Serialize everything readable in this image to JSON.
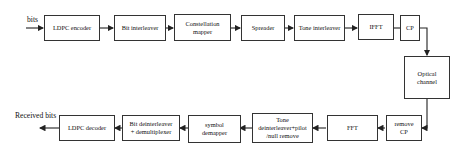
{
  "diagram": {
    "input_label": "bits",
    "output_label": "Received bits",
    "transmitter": [
      {
        "id": "ldpc-encoder",
        "label": "LDPC encoder"
      },
      {
        "id": "bit-interleaver",
        "label": "Bit interleaver"
      },
      {
        "id": "constellation-mapper",
        "label": "Constellation\nmapper"
      },
      {
        "id": "spreader",
        "label": "Spreader"
      },
      {
        "id": "tone-interleaver",
        "label": "Tone interleaver"
      },
      {
        "id": "ifft",
        "label": "IFFT"
      },
      {
        "id": "cp",
        "label": "CP"
      }
    ],
    "channel": {
      "id": "optical-channel",
      "label": "Optical\nchannel"
    },
    "receiver": [
      {
        "id": "remove-cp",
        "label": "remove\nCP"
      },
      {
        "id": "fft",
        "label": "FFT"
      },
      {
        "id": "tone-deinterleaver",
        "label": "Tone\ndeinterleaver+pilot\n/null remove"
      },
      {
        "id": "symbol-demapper",
        "label": "symbol\ndemapper"
      },
      {
        "id": "bit-deinterleaver",
        "label": "Bit deinterleaver\n+ demultiplexer"
      },
      {
        "id": "ldpc-decoder",
        "label": "LDPC decoder"
      }
    ],
    "line_color": "#333333"
  }
}
